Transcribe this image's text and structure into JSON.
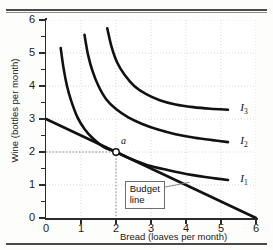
{
  "figure": {
    "title_partial": "",
    "background": "#fdfdfc"
  },
  "chart_data": {
    "type": "line",
    "title": "",
    "subtitle": "",
    "xlabel": "Bread (loaves per month)",
    "ylabel": "Wine (bottles per month)",
    "xlim": [
      0,
      6
    ],
    "ylim": [
      0,
      6
    ],
    "xticks": [
      "0",
      "1",
      "2",
      "3",
      "4",
      "5",
      "6"
    ],
    "yticks": [
      "0",
      "1",
      "2",
      "3",
      "4",
      "5",
      "6"
    ],
    "y_minor_ticks": [
      0.5,
      1.5,
      2.5,
      3.5,
      4.5,
      5.5
    ],
    "grid": "dotted",
    "legend_position": "inline-right",
    "line_color": "#111111",
    "series": [
      {
        "name": "I1",
        "label": "I",
        "sub": "1",
        "kind": "indifference-curve",
        "label_at": [
          5.55,
          1.15
        ],
        "points": [
          [
            0.42,
            5.15
          ],
          [
            0.5,
            4.55
          ],
          [
            0.6,
            4.0
          ],
          [
            0.72,
            3.55
          ],
          [
            0.9,
            3.05
          ],
          [
            1.1,
            2.7
          ],
          [
            1.35,
            2.4
          ],
          [
            1.65,
            2.15
          ],
          [
            2.0,
            2.0
          ],
          [
            2.4,
            1.8
          ],
          [
            2.9,
            1.6
          ],
          [
            3.5,
            1.45
          ],
          [
            4.2,
            1.3
          ],
          [
            4.7,
            1.22
          ],
          [
            5.2,
            1.15
          ]
        ]
      },
      {
        "name": "I2",
        "label": "I",
        "sub": "2",
        "kind": "indifference-curve",
        "label_at": [
          5.55,
          2.3
        ],
        "points": [
          [
            1.1,
            5.55
          ],
          [
            1.2,
            4.95
          ],
          [
            1.33,
            4.45
          ],
          [
            1.5,
            4.0
          ],
          [
            1.72,
            3.6
          ],
          [
            2.0,
            3.3
          ],
          [
            2.35,
            3.05
          ],
          [
            2.75,
            2.85
          ],
          [
            3.2,
            2.68
          ],
          [
            3.7,
            2.54
          ],
          [
            4.25,
            2.43
          ],
          [
            4.75,
            2.36
          ],
          [
            5.2,
            2.3
          ]
        ]
      },
      {
        "name": "I3",
        "label": "I",
        "sub": "3",
        "kind": "indifference-curve",
        "label_at": [
          5.55,
          3.3
        ],
        "points": [
          [
            1.75,
            5.75
          ],
          [
            1.87,
            5.2
          ],
          [
            2.03,
            4.72
          ],
          [
            2.25,
            4.33
          ],
          [
            2.52,
            4.0
          ],
          [
            2.85,
            3.76
          ],
          [
            3.25,
            3.57
          ],
          [
            3.7,
            3.44
          ],
          [
            4.2,
            3.36
          ],
          [
            4.7,
            3.31
          ],
          [
            5.2,
            3.28
          ]
        ]
      },
      {
        "name": "budget-line",
        "label": "Budget line",
        "kind": "budget-line",
        "points": [
          [
            0,
            3
          ],
          [
            6,
            0
          ]
        ]
      }
    ],
    "points_of_interest": [
      {
        "name": "a",
        "label": "a",
        "x": 2,
        "y": 2,
        "marker": "open-circle",
        "guides": [
          "vertical-to-x-axis",
          "horizontal-to-y-axis"
        ]
      }
    ],
    "annotations": [
      {
        "name": "budget-line-callout",
        "text_line1": "Budget",
        "text_line2": "line",
        "box_at": [
          2.25,
          0.72
        ],
        "leader_to": [
          4.1,
          1.08
        ]
      }
    ]
  }
}
